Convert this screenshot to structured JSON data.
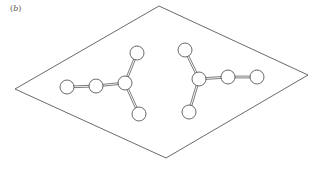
{
  "figure": {
    "label_open": "(",
    "label_letter": "b",
    "label_close": ")"
  },
  "colors": {
    "stroke": "#444444",
    "atom_fill": "#ffffff",
    "background": "#ffffff"
  },
  "rhombus": {
    "points": [
      [
        159,
        6
      ],
      [
        308,
        75
      ],
      [
        166,
        158
      ],
      [
        15,
        89
      ]
    ]
  },
  "molecules": [
    {
      "name": "left-molecule",
      "atoms": [
        [
          67,
          87
        ],
        [
          96,
          86
        ],
        [
          125,
          83
        ],
        [
          137,
          53
        ],
        [
          139,
          114
        ]
      ],
      "bonds": [
        [
          0,
          1
        ],
        [
          1,
          2
        ],
        [
          2,
          3
        ],
        [
          2,
          4
        ]
      ],
      "center": 2
    },
    {
      "name": "right-molecule",
      "atoms": [
        [
          185,
          50
        ],
        [
          199,
          79
        ],
        [
          228,
          77
        ],
        [
          257,
          77
        ],
        [
          189,
          112
        ]
      ],
      "bonds": [
        [
          0,
          1
        ],
        [
          1,
          2
        ],
        [
          2,
          3
        ],
        [
          1,
          4
        ]
      ],
      "center": 1
    }
  ],
  "atom_radius": 7
}
